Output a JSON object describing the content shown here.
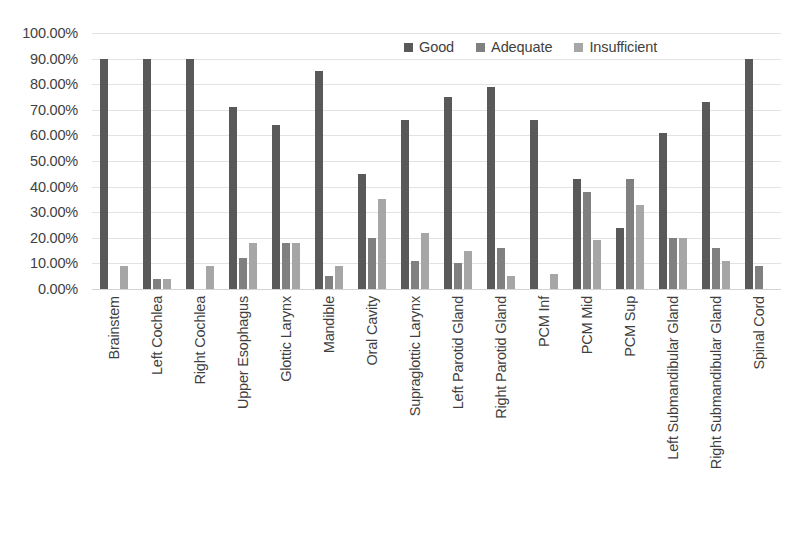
{
  "chart_data": {
    "type": "bar",
    "title": "",
    "xlabel": "",
    "ylabel": "",
    "ylim": [
      0,
      100
    ],
    "ytick_labels": [
      "100.00%",
      "90.00%",
      "80.00%",
      "70.00%",
      "60.00%",
      "50.00%",
      "40.00%",
      "30.00%",
      "20.00%",
      "10.00%",
      "0.00%"
    ],
    "ytick_values": [
      100,
      90,
      80,
      70,
      60,
      50,
      40,
      30,
      20,
      10,
      0
    ],
    "grid": true,
    "legend_position": "top-center",
    "categories": [
      "Brainstem",
      "Left Cochlea",
      "Right Cochlea",
      "Upper Esophagus",
      "Glottic Larynx",
      "Mandible",
      "Oral Cavity",
      "Supraglottic Larynx",
      "Left Parotid Gland",
      "Right Parotid Gland",
      "PCM Inf",
      "PCM Mid",
      "PCM Sup",
      "Left Submandibular Gland",
      "Right Submandibular Gland",
      "Spinal Cord"
    ],
    "series": [
      {
        "name": "Good",
        "color": "#595959",
        "values": [
          90,
          90,
          90,
          71,
          64,
          85,
          45,
          66,
          75,
          79,
          66,
          43,
          24,
          61,
          73,
          90
        ]
      },
      {
        "name": "Adequate",
        "color": "#808080",
        "values": [
          0,
          4,
          0,
          12,
          18,
          5,
          20,
          11,
          10,
          16,
          0,
          38,
          43,
          20,
          16,
          9
        ]
      },
      {
        "name": "Insufficient",
        "color": "#a6a6a6",
        "values": [
          9,
          4,
          9,
          18,
          18,
          9,
          35,
          22,
          15,
          5,
          6,
          19,
          33,
          20,
          11,
          0
        ]
      }
    ]
  },
  "legend": {
    "items": [
      {
        "label": "Good",
        "color": "#595959"
      },
      {
        "label": "Adequate",
        "color": "#808080"
      },
      {
        "label": "Insufficient",
        "color": "#a6a6a6"
      }
    ]
  }
}
